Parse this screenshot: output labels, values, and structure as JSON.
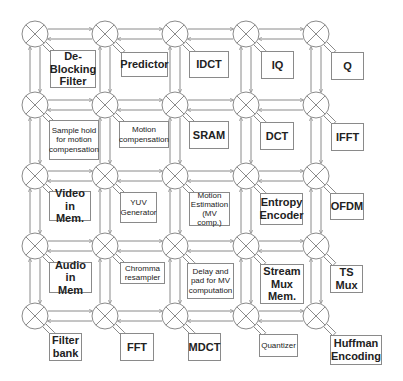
{
  "grid": {
    "cols": [
      35,
      105,
      175,
      246,
      316
    ],
    "rows": [
      34,
      105,
      176,
      246,
      316
    ],
    "router_radius": 13,
    "router_icon": "crossbar-router-icon",
    "line_color": "#8a8a8a"
  },
  "cores": [
    {
      "row": 0,
      "col": 0,
      "label": "De-\nBlocking\nFilter",
      "size": "big",
      "x": 50,
      "y": 50,
      "w": 46,
      "h": 38
    },
    {
      "row": 0,
      "col": 1,
      "label": "Predictor",
      "size": "big",
      "x": 121,
      "y": 52,
      "w": 47,
      "h": 25
    },
    {
      "row": 0,
      "col": 2,
      "label": "IDCT",
      "size": "big",
      "x": 189,
      "y": 51,
      "w": 40,
      "h": 27
    },
    {
      "row": 0,
      "col": 3,
      "label": "IQ",
      "size": "big",
      "x": 261,
      "y": 51,
      "w": 33,
      "h": 28
    },
    {
      "row": 0,
      "col": 4,
      "label": "Q",
      "size": "big",
      "x": 331,
      "y": 52,
      "w": 33,
      "h": 28
    },
    {
      "row": 1,
      "col": 0,
      "label": "Sample hold\nfor motion\ncompensation",
      "size": "small",
      "x": 49,
      "y": 120,
      "w": 50,
      "h": 40
    },
    {
      "row": 1,
      "col": 1,
      "label": "Motion\ncompensation",
      "size": "small",
      "x": 119,
      "y": 121,
      "w": 50,
      "h": 27
    },
    {
      "row": 1,
      "col": 2,
      "label": "SRAM",
      "size": "big",
      "x": 189,
      "y": 121,
      "w": 40,
      "h": 28
    },
    {
      "row": 1,
      "col": 3,
      "label": "DCT",
      "size": "big",
      "x": 260,
      "y": 122,
      "w": 34,
      "h": 28
    },
    {
      "row": 1,
      "col": 4,
      "label": "IFFT",
      "size": "big",
      "x": 331,
      "y": 123,
      "w": 33,
      "h": 28
    },
    {
      "row": 2,
      "col": 0,
      "label": "Video in\nMem.",
      "size": "big",
      "x": 49,
      "y": 191,
      "w": 42,
      "h": 30
    },
    {
      "row": 2,
      "col": 1,
      "label": "YUV\nGenerator",
      "size": "small",
      "x": 120,
      "y": 192,
      "w": 37,
      "h": 31
    },
    {
      "row": 2,
      "col": 2,
      "label": "Motion\nEstimation\n(MV comp.)",
      "size": "small",
      "x": 189,
      "y": 192,
      "w": 41,
      "h": 34
    },
    {
      "row": 2,
      "col": 3,
      "label": "Entropy\nEncoder",
      "size": "big",
      "x": 260,
      "y": 193,
      "w": 43,
      "h": 32
    },
    {
      "row": 2,
      "col": 4,
      "label": "OFDM",
      "size": "big",
      "x": 330,
      "y": 193,
      "w": 34,
      "h": 27
    },
    {
      "row": 3,
      "col": 0,
      "label": "Audio in\nMem",
      "size": "big",
      "x": 49,
      "y": 262,
      "w": 43,
      "h": 31
    },
    {
      "row": 3,
      "col": 1,
      "label": "Chromma\nresampler",
      "size": "small",
      "x": 120,
      "y": 262,
      "w": 45,
      "h": 22
    },
    {
      "row": 3,
      "col": 2,
      "label": "Delay and\npad for MV\ncomputation",
      "size": "small",
      "x": 187,
      "y": 263,
      "w": 47,
      "h": 36
    },
    {
      "row": 3,
      "col": 3,
      "label": "Stream\nMux\nMem.",
      "size": "big",
      "x": 260,
      "y": 264,
      "w": 44,
      "h": 40
    },
    {
      "row": 3,
      "col": 4,
      "label": "TS\nMux",
      "size": "big",
      "x": 330,
      "y": 265,
      "w": 33,
      "h": 28
    },
    {
      "row": 4,
      "col": 0,
      "label": "Filter\nbank",
      "size": "big",
      "x": 49,
      "y": 333,
      "w": 33,
      "h": 28
    },
    {
      "row": 4,
      "col": 1,
      "label": "FFT",
      "size": "big",
      "x": 120,
      "y": 333,
      "w": 34,
      "h": 28
    },
    {
      "row": 4,
      "col": 2,
      "label": "MDCT",
      "size": "big",
      "x": 188,
      "y": 333,
      "w": 33,
      "h": 28
    },
    {
      "row": 4,
      "col": 3,
      "label": "Quantizer",
      "size": "small",
      "x": 259,
      "y": 334,
      "w": 39,
      "h": 23
    },
    {
      "row": 4,
      "col": 4,
      "label": "Huffman\nEncoding",
      "size": "big",
      "x": 330,
      "y": 335,
      "w": 52,
      "h": 30
    }
  ]
}
